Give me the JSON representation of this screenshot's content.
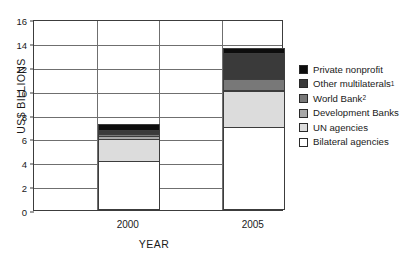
{
  "chart_data": {
    "type": "bar",
    "stacked": true,
    "title": "",
    "xlabel": "YEAR",
    "ylabel": "US$ BILLIONS",
    "categories": [
      "2000",
      "2005"
    ],
    "ylim": [
      0,
      16
    ],
    "yticks": [
      0,
      2,
      4,
      6,
      8,
      10,
      12,
      14,
      16
    ],
    "grid": true,
    "legend_position": "right",
    "series": [
      {
        "name": "Bilateral agencies",
        "color": "#ffffff",
        "legend_order": 6,
        "values": [
          3.9,
          6.8
        ]
      },
      {
        "name": "UN agencies",
        "color": "#dcdcdc",
        "legend_order": 5,
        "values": [
          1.85,
          3.0
        ]
      },
      {
        "name": "Development Banks",
        "color": "#a8a8a8",
        "legend_order": 4,
        "values": [
          0.25,
          0.1
        ]
      },
      {
        "name": "World Bank",
        "color": "#787878",
        "legend_order": 3,
        "values": [
          0.2,
          0.9
        ]
      },
      {
        "name": "Other multilaterals",
        "color": "#3a3a3a",
        "legend_order": 2,
        "values": [
          0.35,
          2.2
        ]
      },
      {
        "name": "Private nonprofit",
        "color": "#0d0d0d",
        "legend_order": 1,
        "values": [
          0.45,
          0.4
        ]
      }
    ],
    "totals": [
      7.0,
      13.4
    ]
  },
  "legend": {
    "items": [
      {
        "label": "Private nonprofit",
        "superscript": "",
        "color": "#0d0d0d"
      },
      {
        "label": "Other multilaterals",
        "superscript": "1",
        "color": "#3a3a3a"
      },
      {
        "label": "World Bank",
        "superscript": "2",
        "color": "#787878"
      },
      {
        "label": "Development Banks",
        "superscript": "",
        "color": "#a8a8a8"
      },
      {
        "label": "UN agencies",
        "superscript": "",
        "color": "#dcdcdc"
      },
      {
        "label": "Bilateral agencies",
        "superscript": "",
        "color": "#ffffff"
      }
    ]
  },
  "axes": {
    "y_title": "US$ BILLIONS",
    "x_title": "YEAR",
    "y_tick_labels": [
      "0",
      "2",
      "4",
      "6",
      "8",
      "10",
      "12",
      "14",
      "16"
    ],
    "x_tick_labels": [
      "2000",
      "2005"
    ]
  },
  "colors": {
    "frame": "#3c3c3c",
    "grid": "#6f6f6f",
    "background": "#ffffff"
  }
}
